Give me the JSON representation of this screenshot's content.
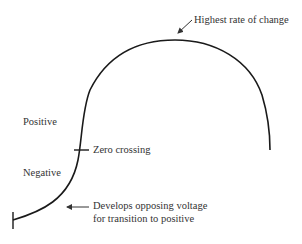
{
  "diagram": {
    "labels": {
      "peak": "Highest rate of change",
      "positive": "Positive",
      "zero": "Zero crossing",
      "negative": "Negative",
      "develops_line1": "Develops opposing voltage",
      "develops_line2": "for transition to positive"
    },
    "colors": {
      "curve": "#1a1a1a",
      "text": "#333333",
      "background": "#ffffff"
    }
  }
}
